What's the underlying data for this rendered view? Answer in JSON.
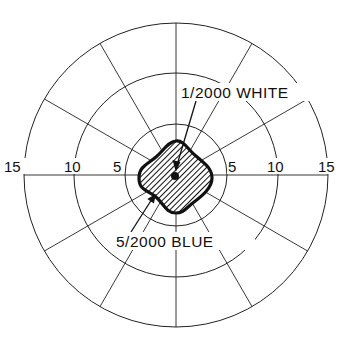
{
  "diagram": {
    "type": "polar-field-plot",
    "center": {
      "x": 176,
      "y": 175
    },
    "px_per_unit": 10.15,
    "rings": [
      5,
      10,
      15
    ],
    "spoke_angles_deg": [
      0,
      30,
      60,
      90,
      120,
      150
    ],
    "axis_labels": {
      "left": [
        "15",
        "10",
        "5"
      ],
      "right": [
        "5",
        "10",
        "15"
      ]
    },
    "annotations": [
      {
        "text": "1/2000 WHITE",
        "target": "central dot"
      },
      {
        "text": "5/2000 BLUE",
        "target": "hatched field boundary"
      }
    ],
    "colors": {
      "line": "#222222",
      "background": "#ffffff"
    }
  }
}
